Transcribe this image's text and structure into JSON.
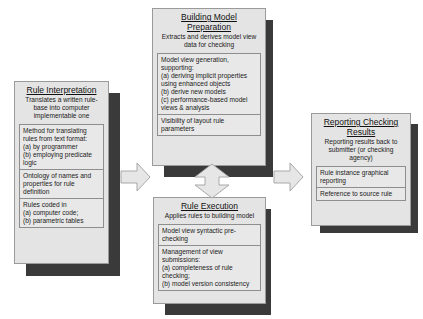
{
  "boxes": {
    "rule_interpretation": {
      "title": "Rule Interpretation",
      "subtitle": "Translates a written rule-base into computer implementable one",
      "sections": [
        "Method for translating rules from text format:\n(a) by programmer\n(b) employing predicate logic",
        "Ontology of names and properties for rule definition",
        "Rules coded in\n(a) computer code;\n(b) parametric tables"
      ]
    },
    "building_model_preparation": {
      "title": "Building Model Preparation",
      "subtitle": "Extracts and derives model view data for checking",
      "sections": [
        "Model view generation, supporting:\n(a) deriving implicit properties using enhanced objects\n(b) derive new models\n(c) performance-based model views & analysis",
        "Visibility of layout rule parameters"
      ]
    },
    "rule_execution": {
      "title": "Rule Execution",
      "subtitle": "Applies rules to building model",
      "sections": [
        "Model view syntactic pre-checking",
        "Management of view submissions:\n(a) completeness of rule checking;\n(b) model version consistency"
      ]
    },
    "reporting_checking_results": {
      "title": "Reporting Checking Results",
      "subtitle": "Reporting results back to submitter (or checking agency)",
      "sections": [
        "Rule instance graphical reporting",
        "Reference to source rule"
      ]
    }
  },
  "arrows": [
    {
      "name": "arrow-right-interpretation-to-execution",
      "direction": "right"
    },
    {
      "name": "arrow-bidirectional-preparation-execution",
      "direction": "up-down"
    },
    {
      "name": "arrow-right-execution-to-reporting",
      "direction": "right"
    }
  ],
  "colors": {
    "box_fill": "#e4e4e4",
    "shadow": "#3a3a3a",
    "arrow_fill": "#e6e6e6",
    "arrow_stroke": "#a8a8a8"
  }
}
